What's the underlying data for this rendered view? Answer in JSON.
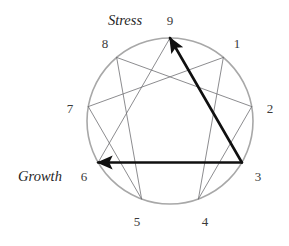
{
  "figure": {
    "name": "enneagram-diagram",
    "background_color": "#ffffff",
    "circle": {
      "center_x": 170,
      "center_y": 121,
      "radius": 83,
      "stroke_color": "#a8a8a8",
      "stroke_width": 1.6
    },
    "inner_line_color": "#6e6e72",
    "inner_line_width": 0.8,
    "arrow_color": "#101010",
    "arrow_width": 2.6
  },
  "points": [
    {
      "number": "9",
      "angle_deg": 270,
      "label_x": 170,
      "label_y": 22
    },
    {
      "number": "1",
      "angle_deg": 310,
      "label_x": 237,
      "label_y": 45
    },
    {
      "number": "2",
      "angle_deg": 350,
      "label_x": 270,
      "label_y": 110
    },
    {
      "number": "3",
      "angle_deg": 30,
      "label_x": 258,
      "label_y": 178
    },
    {
      "number": "4",
      "angle_deg": 70,
      "label_x": 205,
      "label_y": 223
    },
    {
      "number": "5",
      "angle_deg": 110,
      "label_x": 137,
      "label_y": 223
    },
    {
      "number": "6",
      "angle_deg": 150,
      "label_x": 84,
      "label_y": 178
    },
    {
      "number": "7",
      "angle_deg": 190,
      "label_x": 70,
      "label_y": 110
    },
    {
      "number": "8",
      "angle_deg": 230,
      "label_x": 105,
      "label_y": 45
    }
  ],
  "hexad_sequence": [
    "1",
    "4",
    "2",
    "8",
    "5",
    "7"
  ],
  "triangle_sequence": [
    "9",
    "3",
    "6"
  ],
  "arrows": [
    {
      "from": "3",
      "to": "9",
      "name": "stress-arrow-3-to-9"
    },
    {
      "from": "3",
      "to": "6",
      "name": "growth-arrow-3-to-6"
    }
  ],
  "annotations": {
    "stress": {
      "text": "Stress",
      "x": 125,
      "y": 22
    },
    "growth": {
      "text": "Growth",
      "x": 40,
      "y": 178
    }
  }
}
